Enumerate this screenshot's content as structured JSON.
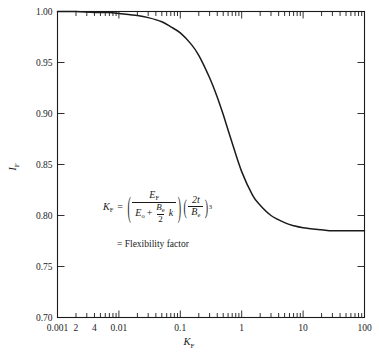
{
  "chart_data": {
    "type": "line",
    "title": "",
    "xlabel": "K_F",
    "ylabel": "I_F",
    "xscale": "log",
    "xlim": [
      0.001,
      100
    ],
    "ylim": [
      0.7,
      1.0
    ],
    "grid": false,
    "legend": null,
    "x_tick_labels": [
      "0.001",
      "2",
      "4",
      "0.01",
      "0.1",
      "1",
      "10",
      "100"
    ],
    "x_tick_values": [
      0.001,
      0.002,
      0.004,
      0.01,
      0.1,
      1,
      10,
      100
    ],
    "y_tick_labels": [
      "0.70",
      "0.75",
      "0.80",
      "0.85",
      "0.90",
      "0.95",
      "1.00"
    ],
    "y_tick_values": [
      0.7,
      0.75,
      0.8,
      0.85,
      0.9,
      0.95,
      1.0
    ],
    "series": [
      {
        "name": "I_F vs K_F",
        "x": [
          0.001,
          0.002,
          0.004,
          0.007,
          0.01,
          0.02,
          0.03,
          0.05,
          0.07,
          0.1,
          0.15,
          0.2,
          0.3,
          0.4,
          0.5,
          0.7,
          1.0,
          1.5,
          2.0,
          3.0,
          5.0,
          7.0,
          10.0,
          20.0,
          30.0,
          50.0,
          100.0
        ],
        "y": [
          1.0,
          1.0,
          0.999,
          0.999,
          0.998,
          0.996,
          0.994,
          0.99,
          0.985,
          0.979,
          0.968,
          0.957,
          0.935,
          0.916,
          0.899,
          0.871,
          0.843,
          0.82,
          0.81,
          0.8,
          0.793,
          0.79,
          0.788,
          0.786,
          0.785,
          0.785,
          0.785
        ]
      }
    ],
    "annotations": [
      {
        "name": "flexibility-factor-formula",
        "text": "K_F = ( E_F / ( E_o + (B_e/2) k ) ) ( 2t / B_e )^3",
        "caption": "= Flexibility factor"
      }
    ]
  },
  "axes": {
    "y_title_symbol": "I",
    "y_title_sub": "F",
    "x_title_symbol": "K",
    "x_title_sub": "F"
  },
  "formula": {
    "lhs_symbol": "K",
    "lhs_sub": "F",
    "equals": "=",
    "open_paren": "(",
    "close_paren": ")",
    "numerator_symbol": "E",
    "numerator_sub": "F",
    "den_first_symbol": "E",
    "den_first_sub": "o",
    "den_plus": "+",
    "den_frac_num_symbol": "B",
    "den_frac_num_sub": "e",
    "den_frac_den": "2",
    "den_k": "k",
    "right_num": "2t",
    "right_den_symbol": "B",
    "right_den_sub": "e",
    "exponent": "3",
    "caption": "= Flexibility factor"
  },
  "style": {
    "line_color": "#1a1a1a",
    "background": "#ffffff",
    "text_color": "#1a1a1a"
  }
}
